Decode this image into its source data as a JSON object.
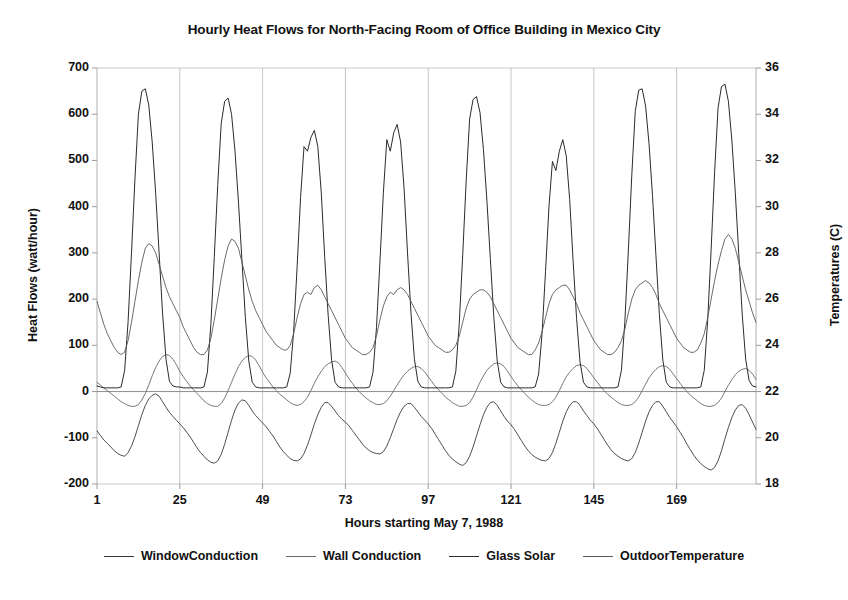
{
  "chart_data": {
    "type": "line",
    "title": "Hourly Heat Flows for North-Facing Room of Office Building in Mexico City",
    "xlabel": "Hours starting May 7, 1988",
    "ylabel": "Heat Flows (watt/hour)",
    "ylabel_right": "Temperatures (C)",
    "grid": true,
    "legend_position": "bottom",
    "xlim": [
      1,
      192
    ],
    "ylim": [
      -200,
      700
    ],
    "ylim_right": [
      18,
      36
    ],
    "xticks": [
      1,
      25,
      49,
      73,
      97,
      121,
      145,
      169
    ],
    "xtick_labels": [
      "1",
      "25",
      "49",
      "73",
      "97",
      "121",
      "145",
      "169"
    ],
    "yticks": [
      -200,
      -100,
      0,
      100,
      200,
      300,
      400,
      500,
      600,
      700
    ],
    "ytick_labels": [
      "-200",
      "-100",
      "0",
      "100",
      "200",
      "300",
      "400",
      "500",
      "600",
      "700"
    ],
    "yticks_right": [
      18,
      20,
      22,
      24,
      26,
      28,
      30,
      32,
      34,
      36
    ],
    "ytick_labels_right": [
      "18",
      "20",
      "22",
      "24",
      "26",
      "28",
      "30",
      "32",
      "34",
      "36"
    ],
    "series": [
      {
        "name": "WindowConduction",
        "axis": "left",
        "color": "#3a3a3a",
        "width": 0.9,
        "peaks_per_day": [
          -140,
          -155,
          -150,
          -135,
          -160,
          -150,
          -150,
          -170
        ],
        "values": [
          -85,
          -95,
          -105,
          -112,
          -120,
          -128,
          -134,
          -138,
          -140,
          -132,
          -118,
          -98,
          -74,
          -50,
          -30,
          -16,
          -8,
          -5,
          -10,
          -22,
          -34,
          -45,
          -54,
          -62,
          -70,
          -78,
          -88,
          -98,
          -110,
          -122,
          -132,
          -140,
          -148,
          -153,
          -155,
          -150,
          -136,
          -114,
          -88,
          -62,
          -40,
          -25,
          -18,
          -20,
          -30,
          -42,
          -52,
          -60,
          -68,
          -76,
          -86,
          -96,
          -108,
          -120,
          -130,
          -138,
          -145,
          -149,
          -150,
          -146,
          -134,
          -116,
          -94,
          -70,
          -50,
          -34,
          -24,
          -24,
          -32,
          -42,
          -52,
          -60,
          -66,
          -74,
          -84,
          -94,
          -104,
          -114,
          -122,
          -128,
          -132,
          -134,
          -135,
          -130,
          -118,
          -100,
          -80,
          -60,
          -44,
          -32,
          -26,
          -26,
          -34,
          -44,
          -54,
          -62,
          -70,
          -80,
          -92,
          -104,
          -116,
          -128,
          -138,
          -146,
          -152,
          -157,
          -160,
          -154,
          -140,
          -120,
          -96,
          -72,
          -50,
          -34,
          -24,
          -22,
          -30,
          -42,
          -54,
          -64,
          -72,
          -82,
          -94,
          -106,
          -118,
          -128,
          -136,
          -142,
          -146,
          -149,
          -150,
          -145,
          -132,
          -112,
          -88,
          -64,
          -44,
          -30,
          -22,
          -22,
          -30,
          -42,
          -52,
          -62,
          -70,
          -80,
          -92,
          -104,
          -116,
          -126,
          -134,
          -140,
          -145,
          -148,
          -150,
          -145,
          -132,
          -112,
          -88,
          -64,
          -44,
          -30,
          -22,
          -22,
          -32,
          -44,
          -56,
          -66,
          -76,
          -88,
          -100,
          -114,
          -126,
          -138,
          -148,
          -156,
          -162,
          -167,
          -170,
          -164,
          -150,
          -128,
          -102,
          -78,
          -56,
          -40,
          -30,
          -28,
          -36,
          -50,
          -66,
          -82
        ]
      },
      {
        "name": "Wall Conduction",
        "axis": "left",
        "color": "#6a6a6a",
        "width": 0.9,
        "peaks_per_day": [
          80,
          78,
          66,
          54,
          62,
          58,
          56,
          50
        ],
        "values": [
          20,
          14,
          8,
          2,
          -4,
          -10,
          -16,
          -22,
          -26,
          -30,
          -32,
          -32,
          -28,
          -18,
          -4,
          14,
          34,
          52,
          66,
          76,
          80,
          78,
          70,
          58,
          44,
          32,
          22,
          12,
          4,
          -4,
          -12,
          -20,
          -26,
          -30,
          -32,
          -32,
          -26,
          -14,
          2,
          20,
          38,
          54,
          66,
          74,
          78,
          76,
          68,
          56,
          42,
          30,
          20,
          10,
          2,
          -6,
          -12,
          -18,
          -24,
          -28,
          -30,
          -28,
          -22,
          -12,
          2,
          18,
          32,
          44,
          54,
          60,
          64,
          66,
          62,
          52,
          40,
          28,
          18,
          8,
          0,
          -8,
          -14,
          -20,
          -24,
          -28,
          -28,
          -26,
          -20,
          -10,
          2,
          14,
          26,
          36,
          44,
          50,
          54,
          54,
          50,
          42,
          32,
          22,
          12,
          4,
          -4,
          -12,
          -18,
          -24,
          -28,
          -32,
          -32,
          -30,
          -24,
          -12,
          4,
          20,
          34,
          46,
          54,
          60,
          62,
          60,
          54,
          44,
          32,
          22,
          12,
          4,
          -4,
          -12,
          -18,
          -24,
          -28,
          -30,
          -30,
          -28,
          -22,
          -12,
          2,
          18,
          32,
          42,
          50,
          56,
          58,
          56,
          50,
          40,
          30,
          20,
          10,
          2,
          -6,
          -12,
          -18,
          -24,
          -28,
          -30,
          -30,
          -28,
          -22,
          -12,
          2,
          16,
          30,
          40,
          48,
          54,
          56,
          54,
          48,
          38,
          28,
          18,
          8,
          0,
          -8,
          -14,
          -20,
          -26,
          -30,
          -32,
          -32,
          -30,
          -24,
          -14,
          0,
          14,
          26,
          36,
          44,
          48,
          50,
          46,
          38,
          26
        ]
      },
      {
        "name": "Glass Solar",
        "axis": "left",
        "color": "#2b2b2b",
        "width": 1.0,
        "peaks_per_day": [
          655,
          635,
          565,
          578,
          638,
          545,
          655,
          665
        ],
        "values": [
          12,
          10,
          8,
          8,
          8,
          8,
          8,
          10,
          45,
          150,
          300,
          460,
          600,
          650,
          655,
          620,
          540,
          430,
          300,
          170,
          70,
          22,
          12,
          10,
          10,
          8,
          8,
          8,
          8,
          8,
          8,
          10,
          42,
          145,
          292,
          448,
          580,
          628,
          635,
          600,
          520,
          410,
          285,
          160,
          66,
          20,
          10,
          8,
          8,
          8,
          8,
          8,
          8,
          8,
          8,
          10,
          40,
          130,
          270,
          420,
          530,
          520,
          550,
          565,
          530,
          430,
          290,
          165,
          68,
          20,
          10,
          8,
          8,
          8,
          8,
          8,
          8,
          8,
          8,
          10,
          42,
          138,
          280,
          430,
          545,
          520,
          560,
          578,
          540,
          440,
          300,
          170,
          70,
          22,
          10,
          8,
          8,
          8,
          8,
          8,
          8,
          8,
          8,
          10,
          44,
          148,
          296,
          456,
          590,
          632,
          638,
          604,
          524,
          414,
          288,
          162,
          66,
          20,
          10,
          8,
          8,
          8,
          8,
          8,
          8,
          8,
          8,
          10,
          38,
          126,
          260,
          400,
          498,
          478,
          520,
          545,
          510,
          415,
          282,
          158,
          64,
          20,
          10,
          8,
          8,
          8,
          8,
          8,
          8,
          8,
          8,
          10,
          46,
          152,
          304,
          468,
          606,
          652,
          655,
          618,
          536,
          424,
          294,
          166,
          68,
          20,
          10,
          8,
          8,
          8,
          8,
          8,
          8,
          8,
          8,
          10,
          46,
          154,
          308,
          474,
          614,
          660,
          665,
          628,
          544,
          430,
          298,
          168,
          70,
          24,
          12,
          10
        ]
      },
      {
        "name": "OutdoorTemperature",
        "axis": "right",
        "color": "#5a5a5a",
        "width": 0.9,
        "peaks_per_day_celsius": [
          28.4,
          28.6,
          26.6,
          26.5,
          26.4,
          26.6,
          26.8,
          28.8
        ],
        "values_celsius": [
          25.9,
          25.4,
          24.9,
          24.5,
          24.2,
          23.9,
          23.7,
          23.6,
          23.7,
          24.2,
          25.0,
          25.9,
          26.8,
          27.6,
          28.2,
          28.4,
          28.3,
          28.0,
          27.5,
          27.0,
          26.5,
          26.1,
          25.8,
          25.5,
          25.2,
          24.8,
          24.5,
          24.2,
          23.9,
          23.7,
          23.6,
          23.6,
          23.8,
          24.3,
          25.1,
          26.0,
          26.9,
          27.7,
          28.3,
          28.6,
          28.5,
          28.2,
          27.6,
          27.0,
          26.4,
          25.9,
          25.5,
          25.2,
          24.9,
          24.6,
          24.4,
          24.2,
          24.0,
          23.9,
          23.8,
          23.8,
          24.0,
          24.5,
          25.2,
          25.8,
          26.2,
          26.3,
          26.2,
          26.5,
          26.6,
          26.4,
          26.1,
          25.8,
          25.5,
          25.2,
          24.9,
          24.6,
          24.3,
          24.1,
          23.9,
          23.8,
          23.7,
          23.6,
          23.6,
          23.7,
          23.9,
          24.4,
          25.1,
          25.7,
          26.1,
          26.3,
          26.2,
          26.4,
          26.5,
          26.4,
          26.2,
          25.9,
          25.6,
          25.3,
          25.0,
          24.7,
          24.4,
          24.2,
          24.0,
          23.9,
          23.8,
          23.7,
          23.7,
          23.8,
          24.0,
          24.4,
          25.0,
          25.6,
          26.0,
          26.2,
          26.3,
          26.4,
          26.4,
          26.3,
          26.1,
          25.8,
          25.5,
          25.2,
          24.9,
          24.6,
          24.3,
          24.1,
          23.9,
          23.8,
          23.7,
          23.6,
          23.6,
          23.8,
          24.1,
          24.6,
          25.2,
          25.8,
          26.2,
          26.4,
          26.5,
          26.6,
          26.6,
          26.4,
          26.1,
          25.8,
          25.4,
          25.1,
          24.8,
          24.5,
          24.2,
          24.0,
          23.8,
          23.7,
          23.6,
          23.6,
          23.7,
          23.9,
          24.2,
          24.7,
          25.4,
          26.0,
          26.4,
          26.6,
          26.7,
          26.8,
          26.7,
          26.5,
          26.2,
          25.8,
          25.5,
          25.2,
          24.9,
          24.6,
          24.3,
          24.1,
          23.9,
          23.8,
          23.7,
          23.7,
          23.8,
          24.1,
          24.5,
          25.2,
          26.0,
          26.8,
          27.5,
          28.1,
          28.6,
          28.8,
          28.6,
          28.2,
          27.6,
          27.0,
          26.4,
          25.9,
          25.4,
          25.0
        ]
      }
    ]
  },
  "legend": {
    "items": [
      {
        "label": "WindowConduction"
      },
      {
        "label": "Wall Conduction"
      },
      {
        "label": "Glass Solar"
      },
      {
        "label": "OutdoorTemperature"
      }
    ]
  }
}
